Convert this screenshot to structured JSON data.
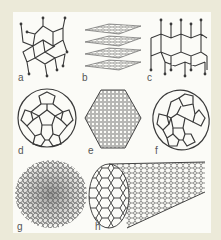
{
  "figure": {
    "background_color": "#ecead9",
    "panel_color": "#fbfbf7",
    "line_color": "#3a3a3a",
    "panels": [
      {
        "label": "a",
        "structure": "diamond"
      },
      {
        "label": "b",
        "structure": "graphite"
      },
      {
        "label": "c",
        "structure": "lonsdaleite"
      },
      {
        "label": "d",
        "structure": "C60 buckminsterfullerene"
      },
      {
        "label": "e",
        "structure": "C540 fullerene"
      },
      {
        "label": "f",
        "structure": "C70 fullerene"
      },
      {
        "label": "g",
        "structure": "amorphous carbon"
      },
      {
        "label": "h",
        "structure": "single-walled carbon nanotube"
      }
    ]
  }
}
